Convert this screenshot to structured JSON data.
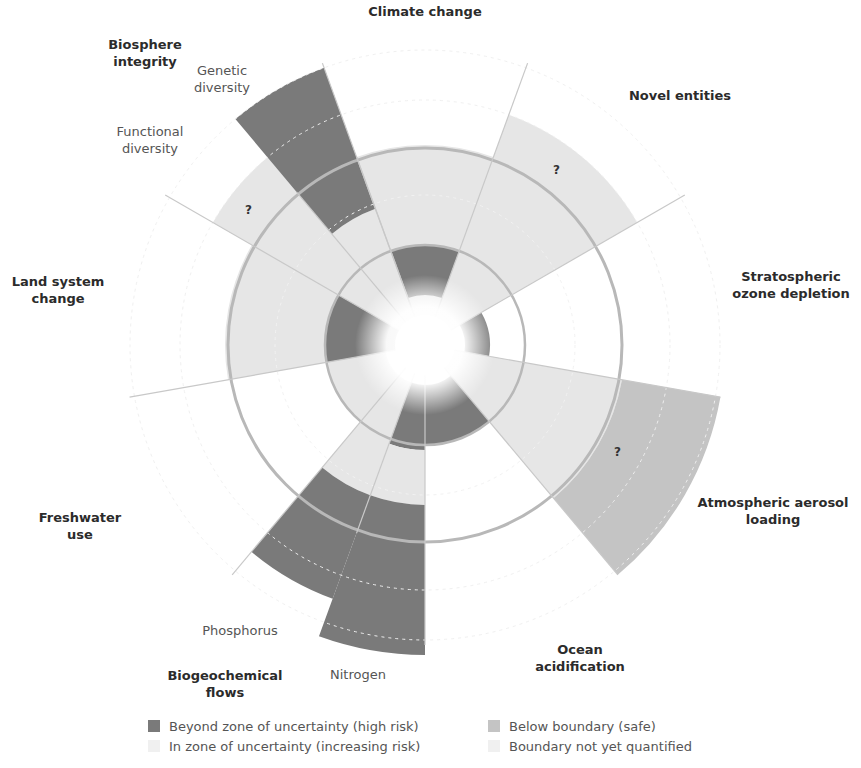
{
  "colors": {
    "beyond": "#7a7a7a",
    "in_zone": "#e6e6e6",
    "below": "#c4c4c4",
    "not_quantified": "#eeeeee",
    "boundary_circle": "#b8b8b8"
  },
  "boundaries": [
    {
      "label": "Climate change",
      "status": "in zone of uncertainty",
      "marker": ""
    },
    {
      "label": "Novel entities",
      "status": "boundary not yet quantified",
      "marker": "?"
    },
    {
      "label": "Stratospheric ozone depletion",
      "status": "below boundary",
      "marker": ""
    },
    {
      "label": "Atmospheric aerosol loading",
      "status": "boundary not yet quantified",
      "marker": "?"
    },
    {
      "label": "Ocean acidification",
      "status": "below boundary",
      "marker": ""
    },
    {
      "label": "Biogeochemical flows",
      "sub": [
        "Nitrogen",
        "Phosphorus"
      ],
      "status": "beyond zone of uncertainty",
      "marker": ""
    },
    {
      "label": "Freshwater use",
      "status": "below boundary",
      "marker": ""
    },
    {
      "label": "Land system change",
      "status": "in zone of uncertainty",
      "marker": ""
    },
    {
      "label": "Biosphere integrity",
      "sub": [
        "Genetic diversity",
        "Functional diversity"
      ],
      "status": "beyond zone of uncertainty / not quantified",
      "marker": "?"
    }
  ],
  "labels": {
    "climate": "Climate change",
    "novel": "Novel entities",
    "ozone_1": "Stratospheric",
    "ozone_2": "ozone depletion",
    "aerosol_1": "Atmospheric aerosol",
    "aerosol_2": "loading",
    "ocean_1": "Ocean",
    "ocean_2": "acidification",
    "biogeo_1": "Biogeochemical",
    "biogeo_2": "flows",
    "nitrogen": "Nitrogen",
    "phosphorus": "Phosphorus",
    "freshwater_1": "Freshwater",
    "freshwater_2": "use",
    "land_1": "Land system",
    "land_2": "change",
    "biosphere_1": "Biosphere",
    "biosphere_2": "integrity",
    "genetic_1": "Genetic",
    "genetic_2": "diversity",
    "functional_1": "Functional",
    "functional_2": "diversity",
    "question": "?"
  },
  "legend": [
    {
      "label": "Beyond zone of uncertainty (high risk)",
      "color": "#7a7a7a"
    },
    {
      "label": "In zone of uncertainty (increasing risk)",
      "color": "#eeeeee"
    },
    {
      "label": "Below boundary (safe)",
      "color": "#c4c4c4"
    },
    {
      "label": "Boundary not yet quantified",
      "color": "#f0f0f0"
    }
  ]
}
